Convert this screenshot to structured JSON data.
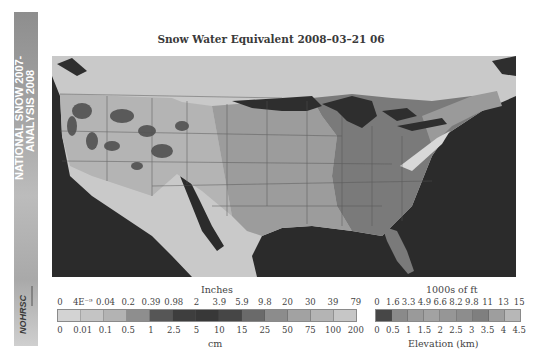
{
  "side_strip": {
    "title_line1": "NATIONAL SNOW 2007-",
    "title_line2": "ANALYSIS 2008",
    "logo_text": "NOHRSC"
  },
  "title": "Snow Water Equivalent 2008–03–21 06",
  "swe_legend": {
    "top_label": "Inches",
    "bottom_label": "cm",
    "inch_ticks": [
      "0",
      "4E⁻⁹",
      "0.04",
      "0.2",
      "0.39",
      "0.98",
      "2",
      "3.9",
      "5.9",
      "9.8",
      "20",
      "30",
      "39",
      "79"
    ],
    "cm_ticks": [
      "0",
      "0.01",
      "0.1",
      "0.5",
      "1",
      "2.5",
      "5",
      "10",
      "15",
      "25",
      "50",
      "75",
      "100",
      "200"
    ],
    "colors": [
      "#d3d3d3",
      "#c4c4c4",
      "#b3b3b3",
      "#8e8e8e",
      "#565656",
      "#3e3e3e",
      "#383838",
      "#464646",
      "#6a6a6a",
      "#8c8c8c",
      "#a2a2a2",
      "#b4b4b4",
      "#c6c6c6"
    ]
  },
  "elev_legend": {
    "top_label": "1000s of ft",
    "bottom_label": "Elevation (km)",
    "ft_ticks": [
      "0",
      "1.6",
      "3.3",
      "4.9",
      "6.6",
      "8.2",
      "9.8",
      "11",
      "13",
      "15"
    ],
    "km_ticks": [
      "0",
      "0.5",
      "1",
      "1.5",
      "2",
      "2.5",
      "3",
      "3.5",
      "4",
      "4.5"
    ],
    "colors": [
      "#474747",
      "#8a8a8a",
      "#9a9a9a",
      "#a2a2a2",
      "#969696",
      "#8d8d8d",
      "#7f7f7f",
      "#9e9e9e",
      "#b7b7b7"
    ]
  },
  "map": {
    "ocean_color": "#2b2b2b",
    "land_outside_us_color": "#c9c9c9",
    "great_lakes_color": "#2e2e2e",
    "no_snow_land_color": "#7a7a7a",
    "plains_color": "#9a9a9a",
    "mountain_snow_color": "#b4b4b4"
  }
}
